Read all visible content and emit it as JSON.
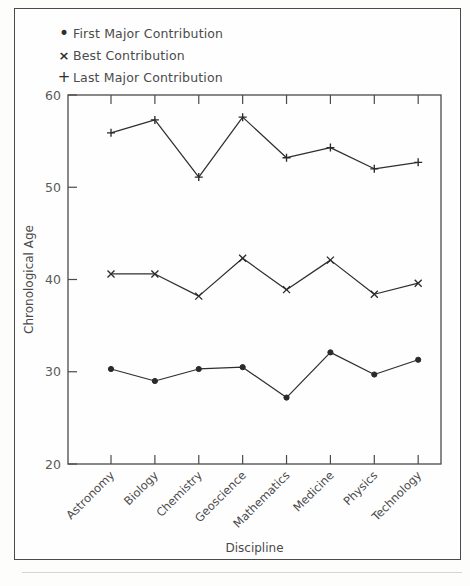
{
  "figure": {
    "legend_position": "top-left",
    "frame": true
  },
  "legend": {
    "entries": [
      {
        "marker": "dot-icon",
        "glyph": "•",
        "label": "First Major Contribution"
      },
      {
        "marker": "cross-icon",
        "glyph": "×",
        "label": "Best Contribution"
      },
      {
        "marker": "plus-icon",
        "glyph": "+",
        "label": "Last Major Contribution"
      }
    ]
  },
  "chart_data": {
    "type": "line",
    "title": "",
    "xlabel": "Discipline",
    "ylabel": "Chronological Age",
    "categories": [
      "Astronomy",
      "Biology",
      "Chemistry",
      "Geoscience",
      "Mathematics",
      "Medicine",
      "Physics",
      "Technology"
    ],
    "ylim": [
      20,
      60
    ],
    "yticks": [
      20,
      30,
      40,
      50,
      60
    ],
    "ytick_labels": [
      "20",
      "30",
      "40",
      "50",
      "60"
    ],
    "grid": false,
    "xtick_rotation": 45,
    "series": [
      {
        "name": "First Major Contribution",
        "marker": "dot",
        "values": [
          30.3,
          29.0,
          30.3,
          30.5,
          27.2,
          32.1,
          29.7,
          31.3
        ]
      },
      {
        "name": "Best Contribution",
        "marker": "cross",
        "values": [
          40.6,
          40.6,
          38.2,
          42.3,
          38.9,
          42.1,
          38.4,
          39.6
        ]
      },
      {
        "name": "Last Major Contribution",
        "marker": "plus",
        "values": [
          55.9,
          57.3,
          51.1,
          57.6,
          53.2,
          54.3,
          52.0,
          52.7
        ]
      }
    ]
  }
}
